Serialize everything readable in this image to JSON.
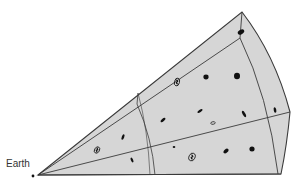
{
  "diagram": {
    "type": "cosmic-wedge",
    "observer_label": "Earth",
    "colors": {
      "background": "#ffffff",
      "fill": "#d6d6d6",
      "stroke": "#3a3a3a",
      "galaxy": "#111111"
    },
    "galaxies": [
      {
        "x": 241,
        "y": 32,
        "rx": 3.5,
        "ry": 2.2,
        "rot": -30,
        "kind": "elliptical"
      },
      {
        "x": 177,
        "y": 82,
        "rx": 2.5,
        "ry": 4,
        "rot": 15,
        "kind": "spiral"
      },
      {
        "x": 206,
        "y": 77,
        "rx": 2.6,
        "ry": 2.4,
        "rot": 0,
        "kind": "elliptical"
      },
      {
        "x": 237,
        "y": 76,
        "rx": 3,
        "ry": 3.2,
        "rot": 0,
        "kind": "elliptical"
      },
      {
        "x": 244,
        "y": 114,
        "rx": 1.3,
        "ry": 3.5,
        "rot": -30,
        "kind": "elongated"
      },
      {
        "x": 163,
        "y": 120,
        "rx": 1.4,
        "ry": 3,
        "rot": 50,
        "kind": "elongated"
      },
      {
        "x": 200,
        "y": 111,
        "rx": 1.2,
        "ry": 3,
        "rot": 55,
        "kind": "elongated"
      },
      {
        "x": 213,
        "y": 123,
        "rx": 2.2,
        "ry": 1.3,
        "rot": -10,
        "kind": "hollow"
      },
      {
        "x": 123,
        "y": 137,
        "rx": 1.2,
        "ry": 3,
        "rot": 20,
        "kind": "elongated"
      },
      {
        "x": 97,
        "y": 150,
        "rx": 2.4,
        "ry": 3.4,
        "rot": 30,
        "kind": "spiral"
      },
      {
        "x": 132,
        "y": 160,
        "rx": 1.1,
        "ry": 2.6,
        "rot": -25,
        "kind": "elongated"
      },
      {
        "x": 174,
        "y": 147,
        "rx": 1.3,
        "ry": 1.1,
        "rot": 0,
        "kind": "elliptical"
      },
      {
        "x": 192,
        "y": 157,
        "rx": 3,
        "ry": 4,
        "rot": 25,
        "kind": "spiral"
      },
      {
        "x": 226,
        "y": 151,
        "rx": 1.8,
        "ry": 3,
        "rot": 45,
        "kind": "elongated"
      },
      {
        "x": 252,
        "y": 149,
        "rx": 2.6,
        "ry": 2.5,
        "rot": 0,
        "kind": "elliptical"
      },
      {
        "x": 275,
        "y": 110,
        "rx": 1.3,
        "ry": 2.8,
        "rot": -10,
        "kind": "elongated"
      }
    ]
  }
}
